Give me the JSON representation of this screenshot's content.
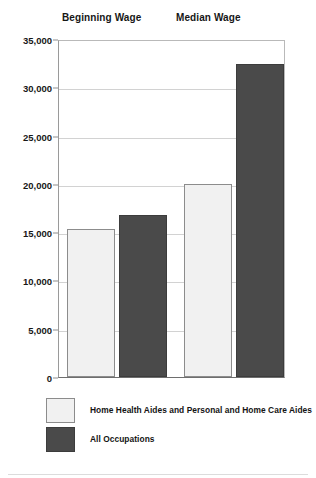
{
  "chart_data": {
    "type": "bar",
    "title": "",
    "subtitle": "",
    "xlabel": "",
    "ylabel": "",
    "categories": [
      "Beginning Wage",
      "Median Wage"
    ],
    "series": [
      {
        "name": "Home Health Aides and Personal and Home Care Aides",
        "color": "#f1f1f1",
        "values": [
          15300,
          20000
        ]
      },
      {
        "name": "All Occupations",
        "color": "#4a4a4a",
        "values": [
          16800,
          32400
        ]
      }
    ],
    "ylim": [
      0,
      35000
    ],
    "ytick_values": [
      0,
      5000,
      10000,
      15000,
      20000,
      25000,
      30000,
      35000
    ],
    "ytick_labels": [
      "0",
      "5,000",
      "10,000",
      "15,000",
      "20,000",
      "25,000",
      "30,000",
      "35,000"
    ],
    "grid": true,
    "grid_axis": "y",
    "legend_position": "bottom-left",
    "bar_outline_color": "#8c8c8c"
  },
  "headers": [
    {
      "label": "Beginning Wage"
    },
    {
      "label": "Median Wage"
    }
  ],
  "legend": {
    "items": [
      {
        "label": "Home Health Aides and Personal and Home Care Aides",
        "swatch": "light"
      },
      {
        "label": "All Occupations",
        "swatch": "dark"
      }
    ]
  }
}
